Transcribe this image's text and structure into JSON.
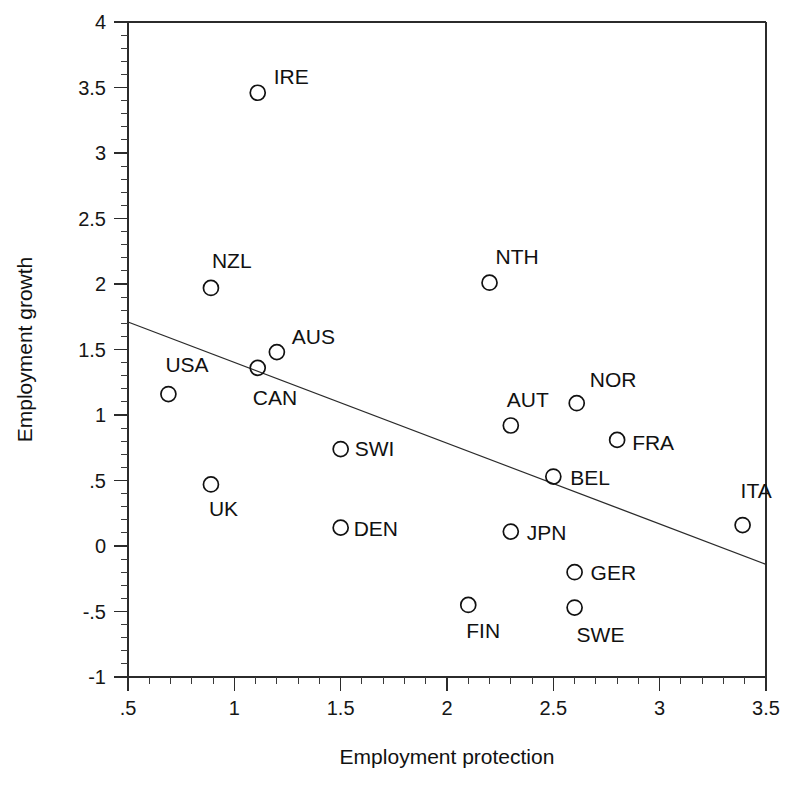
{
  "chart_data": {
    "type": "scatter",
    "title": "",
    "xlabel": "Employment protection",
    "ylabel": "Employment growth",
    "xlim": [
      0.5,
      3.5
    ],
    "ylim": [
      -1,
      4
    ],
    "grid": false,
    "legend": null,
    "x_ticks": [
      ".5",
      "1",
      "1.5",
      "2",
      "2.5",
      "3",
      "3.5"
    ],
    "x_tick_values": [
      0.5,
      1,
      1.5,
      2,
      2.5,
      3,
      3.5
    ],
    "x_minor_step": 0.1,
    "y_ticks": [
      "-1",
      "-.5",
      "0",
      ".5",
      "1",
      "1.5",
      "2",
      "2.5",
      "3",
      "3.5",
      "4"
    ],
    "y_tick_values": [
      -1,
      -0.5,
      0,
      0.5,
      1,
      1.5,
      2,
      2.5,
      3,
      3.5,
      4
    ],
    "y_minor_step": 0.1,
    "marker_style": "open-circle",
    "points": [
      {
        "label": "IRE",
        "x": 1.11,
        "y": 3.46,
        "label_dx": 16,
        "label_dy": -9
      },
      {
        "label": "NZL",
        "x": 0.89,
        "y": 1.97,
        "label_dx": 1,
        "label_dy": -20
      },
      {
        "label": "NTH",
        "x": 2.2,
        "y": 2.01,
        "label_dx": 6,
        "label_dy": -19
      },
      {
        "label": "AUS",
        "x": 1.2,
        "y": 1.48,
        "label_dx": 15,
        "label_dy": -8
      },
      {
        "label": "CAN",
        "x": 1.11,
        "y": 1.36,
        "label_dx": -5,
        "label_dy": 37
      },
      {
        "label": "USA",
        "x": 0.69,
        "y": 1.16,
        "label_dx": -3,
        "label_dy": -22
      },
      {
        "label": "NOR",
        "x": 2.61,
        "y": 1.09,
        "label_dx": 13,
        "label_dy": -16
      },
      {
        "label": "AUT",
        "x": 2.3,
        "y": 0.92,
        "label_dx": -4,
        "label_dy": -18
      },
      {
        "label": "FRA",
        "x": 2.8,
        "y": 0.81,
        "label_dx": 15,
        "label_dy": 10
      },
      {
        "label": "SWI",
        "x": 1.5,
        "y": 0.74,
        "label_dx": 14,
        "label_dy": 7
      },
      {
        "label": "BEL",
        "x": 2.5,
        "y": 0.53,
        "label_dx": 17,
        "label_dy": 8
      },
      {
        "label": "UK",
        "x": 0.89,
        "y": 0.47,
        "label_dx": -2,
        "label_dy": 32
      },
      {
        "label": "ITA",
        "x": 3.39,
        "y": 0.16,
        "label_dx": -2,
        "label_dy": -27
      },
      {
        "label": "DEN",
        "x": 1.5,
        "y": 0.14,
        "label_dx": 13,
        "label_dy": 8
      },
      {
        "label": "JPN",
        "x": 2.3,
        "y": 0.11,
        "label_dx": 16,
        "label_dy": 8
      },
      {
        "label": "GER",
        "x": 2.6,
        "y": -0.2,
        "label_dx": 16,
        "label_dy": 8
      },
      {
        "label": "FIN",
        "x": 2.1,
        "y": -0.45,
        "label_dx": -2,
        "label_dy": 33
      },
      {
        "label": "SWE",
        "x": 2.6,
        "y": -0.47,
        "label_dx": 2,
        "label_dy": 34
      }
    ],
    "fit_line": {
      "name": "regression-line",
      "x_start": 0.5,
      "y_start": 1.71,
      "x_end": 3.5,
      "y_end": -0.14
    }
  },
  "colors": {
    "axis": "#2b2b2b",
    "marker": "#111111",
    "text": "#111111",
    "background": "#ffffff"
  }
}
